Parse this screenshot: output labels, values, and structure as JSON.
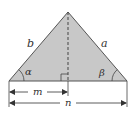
{
  "diagram": {
    "type": "triangle-with-altitude",
    "colors": {
      "fill": "#c8c8c8",
      "stroke": "#555555",
      "text": "#333333",
      "background": "#ffffff"
    },
    "vertices": {
      "apex": [
        68,
        12
      ],
      "left": [
        9,
        81
      ],
      "right": [
        127,
        81
      ],
      "foot": [
        68,
        81
      ]
    },
    "labels": {
      "side_left": "b",
      "side_right": "a",
      "angle_left": "α",
      "angle_right": "β",
      "segment_m": "m",
      "segment_n": "n"
    }
  }
}
